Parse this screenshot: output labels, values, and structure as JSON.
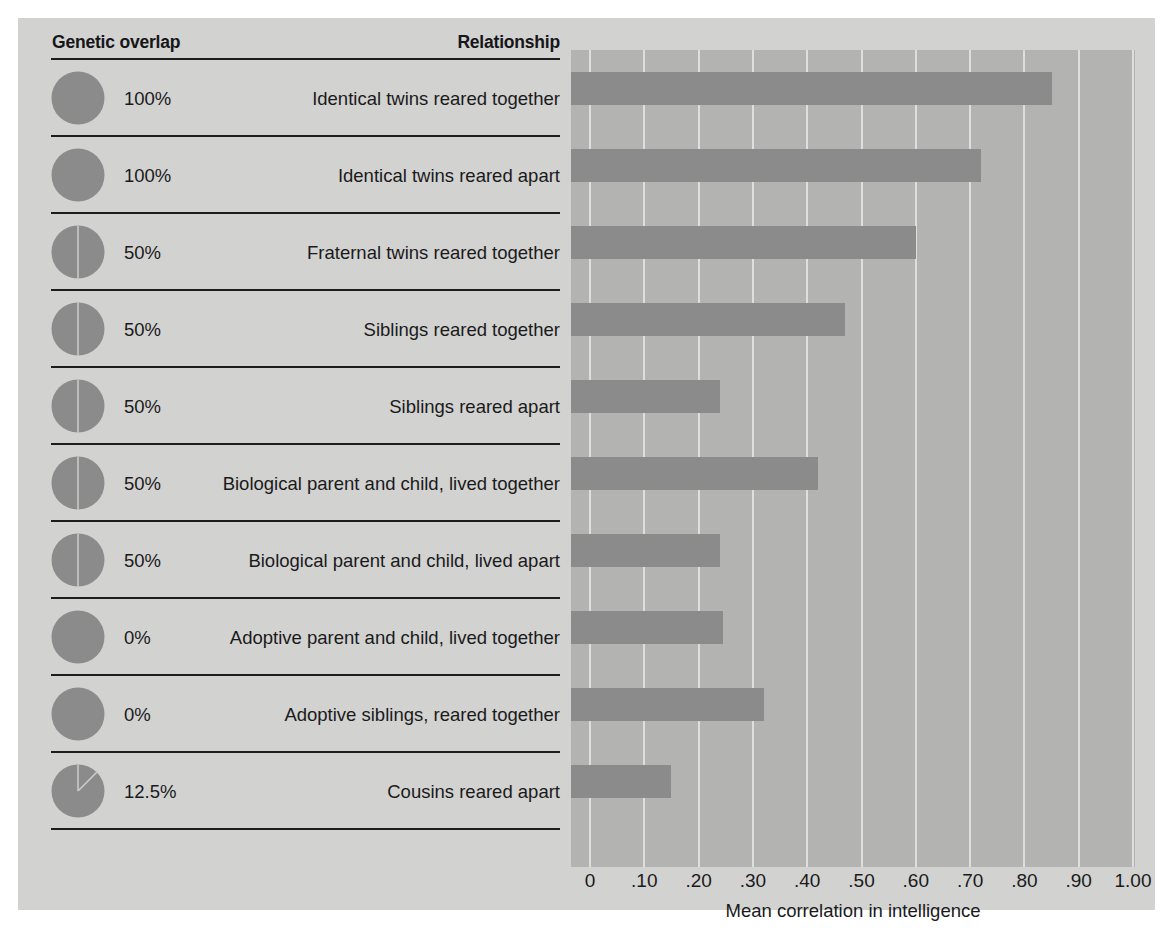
{
  "table": {
    "header": {
      "genetic_overlap": "Genetic overlap",
      "relationship": "Relationship"
    },
    "rows": [
      {
        "percent": "100%",
        "overlap_fraction": 1.0,
        "relationship": "Identical twins reared together",
        "correlation": 0.85
      },
      {
        "percent": "100%",
        "overlap_fraction": 1.0,
        "relationship": "Identical twins reared apart",
        "correlation": 0.72
      },
      {
        "percent": "50%",
        "overlap_fraction": 0.5,
        "relationship": "Fraternal twins reared together",
        "correlation": 0.6
      },
      {
        "percent": "50%",
        "overlap_fraction": 0.5,
        "relationship": "Siblings reared together",
        "correlation": 0.47
      },
      {
        "percent": "50%",
        "overlap_fraction": 0.5,
        "relationship": "Siblings reared apart",
        "correlation": 0.24
      },
      {
        "percent": "50%",
        "overlap_fraction": 0.5,
        "relationship": "Biological parent and child, lived together",
        "correlation": 0.42
      },
      {
        "percent": "50%",
        "overlap_fraction": 0.5,
        "relationship": "Biological parent and child, lived apart",
        "correlation": 0.24
      },
      {
        "percent": "0%",
        "overlap_fraction": 0.0,
        "relationship": "Adoptive parent and child, lived together",
        "correlation": 0.245
      },
      {
        "percent": "0%",
        "overlap_fraction": 0.0,
        "relationship": "Adoptive siblings, reared together",
        "correlation": 0.32
      },
      {
        "percent": "12.5%",
        "overlap_fraction": 0.125,
        "relationship": "Cousins reared apart",
        "correlation": 0.15
      }
    ]
  },
  "chart_data": {
    "type": "bar",
    "orientation": "horizontal",
    "title": "",
    "xlabel": "Mean correlation in intelligence",
    "ylabel": "",
    "xlim": [
      0,
      1.0
    ],
    "grid": true,
    "legend": null,
    "categories": [
      "Identical twins reared together",
      "Identical twins reared apart",
      "Fraternal twins reared together",
      "Siblings reared together",
      "Siblings reared apart",
      "Biological parent and child, lived together",
      "Biological parent and child, lived apart",
      "Adoptive parent and child, lived together",
      "Adoptive siblings, reared together",
      "Cousins reared apart"
    ],
    "values": [
      0.85,
      0.72,
      0.6,
      0.47,
      0.24,
      0.42,
      0.24,
      0.245,
      0.32,
      0.15
    ],
    "tick_values": [
      0,
      0.1,
      0.2,
      0.3,
      0.4,
      0.5,
      0.6,
      0.7,
      0.8,
      0.9,
      1.0
    ],
    "tick_labels": [
      "0",
      ".10",
      ".20",
      ".30",
      ".40",
      ".50",
      ".60",
      ".70",
      ".80",
      ".90",
      "1.00"
    ]
  },
  "colors": {
    "panel_background": "#d2d2d0",
    "plot_background": "#b3b3b1",
    "bar": "#8b8b8b",
    "gridline": "#dedede",
    "rule": "#1d1d1f",
    "text": "#1a1a1c",
    "pie_fill": "#8b8b8b"
  }
}
